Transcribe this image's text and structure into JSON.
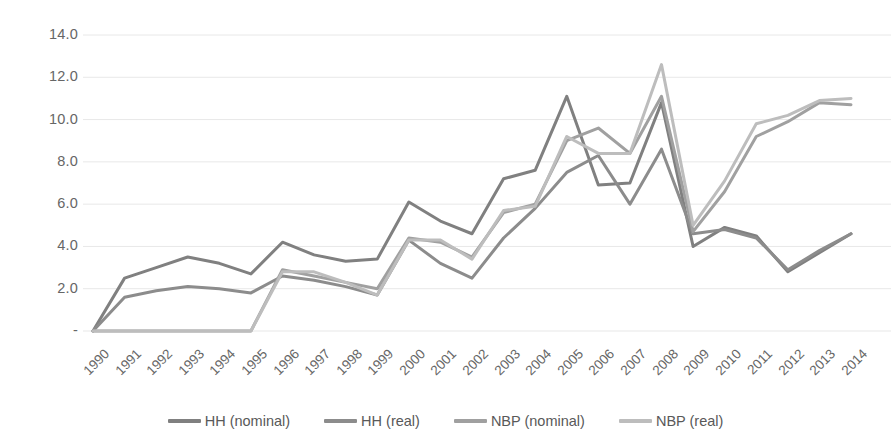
{
  "chart_data": {
    "type": "line",
    "title": "",
    "xlabel": "",
    "ylabel": "",
    "ylim": [
      0,
      14
    ],
    "yticks": [
      "-",
      "2.0",
      "4.0",
      "6.0",
      "8.0",
      "10.0",
      "12.0",
      "14.0"
    ],
    "ytick_values": [
      0,
      2,
      4,
      6,
      8,
      10,
      12,
      14
    ],
    "grid": "horizontal",
    "legend_position": "bottom",
    "categories": [
      "1990",
      "1991",
      "1992",
      "1993",
      "1994",
      "1995",
      "1996",
      "1997",
      "1998",
      "1999",
      "2000",
      "2001",
      "2002",
      "2003",
      "2004",
      "2005",
      "2006",
      "2007",
      "2008",
      "2009",
      "2010",
      "2011",
      "2012",
      "2013",
      "2014"
    ],
    "series": [
      {
        "name": "HH (nominal)",
        "color": "#808080",
        "values": [
          0.0,
          2.5,
          3.0,
          3.5,
          3.2,
          2.7,
          4.2,
          3.6,
          3.3,
          3.4,
          6.1,
          5.2,
          4.6,
          7.2,
          7.6,
          11.1,
          6.9,
          7.0,
          10.8,
          4.0,
          4.9,
          4.5,
          2.8,
          3.7,
          4.6
        ]
      },
      {
        "name": "HH (real)",
        "color": "#8c8c8c",
        "values": [
          0.0,
          1.6,
          1.9,
          2.1,
          2.0,
          1.8,
          2.6,
          2.4,
          2.1,
          1.7,
          4.3,
          3.2,
          2.5,
          4.4,
          5.8,
          7.5,
          8.3,
          6.0,
          8.6,
          4.6,
          4.8,
          4.4,
          2.9,
          3.8,
          4.6
        ]
      },
      {
        "name": "NBP (nominal)",
        "color": "#a0a0a0",
        "values": [
          0.0,
          0.0,
          0.0,
          0.0,
          0.0,
          0.0,
          2.9,
          2.6,
          2.3,
          2.0,
          4.4,
          4.2,
          3.5,
          5.6,
          6.0,
          9.0,
          9.6,
          8.4,
          11.1,
          4.7,
          6.6,
          9.2,
          9.9,
          10.8,
          10.7
        ]
      },
      {
        "name": "NBP (real)",
        "color": "#bdbdbd",
        "values": [
          0.0,
          0.0,
          0.0,
          0.0,
          0.0,
          0.0,
          2.8,
          2.8,
          2.3,
          1.7,
          4.3,
          4.3,
          3.4,
          5.7,
          5.9,
          9.2,
          8.4,
          8.4,
          12.6,
          5.0,
          7.1,
          9.8,
          10.2,
          10.9,
          11.0
        ]
      }
    ]
  },
  "legend": {
    "items": [
      {
        "label": "HH (nominal)"
      },
      {
        "label": "HH (real)"
      },
      {
        "label": "NBP (nominal)"
      },
      {
        "label": "NBP (real)"
      }
    ]
  },
  "axis": {
    "grid_color": "#e8e8e8"
  }
}
